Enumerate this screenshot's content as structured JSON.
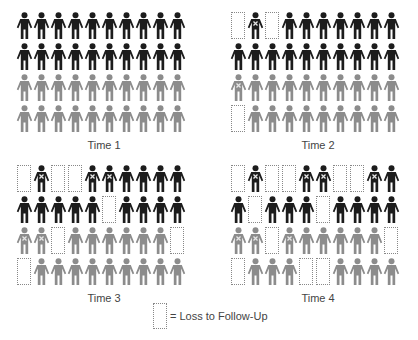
{
  "colors": {
    "black": "#1c1c1c",
    "gray": "#8c8c8c",
    "mark": "#e6e6e6",
    "box": "#888888"
  },
  "legend": {
    "symbol": "dotted-box",
    "label": "= Loss to Follow-Up"
  },
  "panels": [
    {
      "label": "Time 1",
      "rows": [
        [
          "B",
          "B",
          "B",
          "B",
          "B",
          "B",
          "B",
          "B",
          "B",
          "B"
        ],
        [
          "B",
          "B",
          "B",
          "B",
          "B",
          "B",
          "B",
          "B",
          "B",
          "B"
        ],
        [
          "G",
          "G",
          "G",
          "G",
          "G",
          "G",
          "G",
          "G",
          "G",
          "G"
        ],
        [
          "G",
          "G",
          "G",
          "G",
          "G",
          "G",
          "G",
          "G",
          "G",
          "G"
        ]
      ]
    },
    {
      "label": "Time 2",
      "rows": [
        [
          "L",
          "BX",
          "L",
          "B",
          "B",
          "B",
          "B",
          "B",
          "B",
          "B"
        ],
        [
          "B",
          "B",
          "B",
          "B",
          "B",
          "B",
          "B",
          "B",
          "B",
          "B"
        ],
        [
          "GX",
          "G",
          "G",
          "G",
          "G",
          "G",
          "G",
          "G",
          "G",
          "G"
        ],
        [
          "L",
          "G",
          "G",
          "G",
          "G",
          "G",
          "G",
          "G",
          "G",
          "G"
        ]
      ]
    },
    {
      "label": "Time 3",
      "rows": [
        [
          "L",
          "BX",
          "L",
          "L",
          "BX",
          "BX",
          "B",
          "B",
          "B",
          "B"
        ],
        [
          "B",
          "B",
          "B",
          "B",
          "B",
          "L",
          "B",
          "B",
          "B",
          "B"
        ],
        [
          "GX",
          "GX",
          "L",
          "G",
          "G",
          "G",
          "G",
          "G",
          "G",
          "L"
        ],
        [
          "L",
          "G",
          "G",
          "G",
          "G",
          "G",
          "G",
          "G",
          "G",
          "G"
        ]
      ]
    },
    {
      "label": "Time 4",
      "rows": [
        [
          "L",
          "BX",
          "L",
          "L",
          "BX",
          "BX",
          "L",
          "L",
          "BX",
          "B"
        ],
        [
          "B",
          "L",
          "B",
          "B",
          "B",
          "L",
          "B",
          "B",
          "B",
          "B"
        ],
        [
          "GX",
          "GX",
          "L",
          "GX",
          "G",
          "G",
          "G",
          "G",
          "G",
          "L"
        ],
        [
          "L",
          "G",
          "G",
          "G",
          "L",
          "L",
          "G",
          "G",
          "G",
          "G"
        ]
      ]
    }
  ],
  "key": {
    "B": "black-person",
    "G": "gray-person",
    "BX": "black-person-marked",
    "GX": "gray-person-marked",
    "L": "loss-to-follow-up"
  }
}
